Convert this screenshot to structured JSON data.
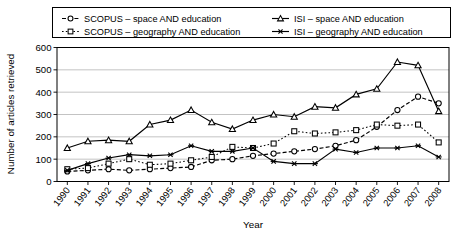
{
  "chart_data": {
    "type": "line",
    "title": "",
    "xlabel": "Year",
    "ylabel": "Number of articles retrieved",
    "x": [
      1990,
      1991,
      1992,
      1993,
      1994,
      1995,
      1996,
      1997,
      1998,
      1999,
      2000,
      2001,
      2002,
      2003,
      2004,
      2005,
      2006,
      2007,
      2008
    ],
    "categories": [
      "1990",
      "1991",
      "1992",
      "1993",
      "1994",
      "1995",
      "1996",
      "1997",
      "1998",
      "1999",
      "2000",
      "2001",
      "2002",
      "2003",
      "2004",
      "2005",
      "2006",
      "2007",
      "2008"
    ],
    "ylim": [
      0,
      600
    ],
    "yticks": [
      0,
      100,
      200,
      300,
      400,
      500,
      600
    ],
    "ytick_labels": [
      "0",
      "100",
      "200",
      "300",
      "400",
      "500",
      "600"
    ],
    "grid": true,
    "legend_position": "top",
    "series": [
      {
        "name": "SCOPUS – space AND education",
        "marker": "open-circle",
        "line_style": "dashed",
        "values": [
          45,
          50,
          55,
          50,
          55,
          60,
          65,
          95,
          100,
          115,
          125,
          135,
          145,
          160,
          185,
          245,
          320,
          380,
          350
        ]
      },
      {
        "name": "SCOPUS – geography AND education",
        "marker": "open-square",
        "line_style": "dotted",
        "values": [
          55,
          60,
          80,
          100,
          75,
          80,
          95,
          110,
          155,
          150,
          170,
          225,
          215,
          220,
          230,
          255,
          250,
          255,
          175
        ]
      },
      {
        "name": "ISI – space AND education",
        "marker": "open-triangle",
        "line_style": "solid",
        "values": [
          150,
          180,
          185,
          180,
          255,
          275,
          320,
          265,
          235,
          275,
          300,
          290,
          335,
          330,
          390,
          415,
          535,
          520,
          315
        ]
      },
      {
        "name": "ISI – geography AND education",
        "marker": "star",
        "line_style": "solid",
        "values": [
          50,
          80,
          105,
          120,
          115,
          120,
          160,
          135,
          135,
          150,
          90,
          80,
          80,
          145,
          130,
          150,
          150,
          160,
          110
        ]
      }
    ]
  },
  "legend": {
    "entries": [
      {
        "label": "SCOPUS – space AND education"
      },
      {
        "label": "ISI – space AND education"
      },
      {
        "label": "SCOPUS – geography AND education"
      },
      {
        "label": "ISI – geography AND education"
      }
    ]
  }
}
